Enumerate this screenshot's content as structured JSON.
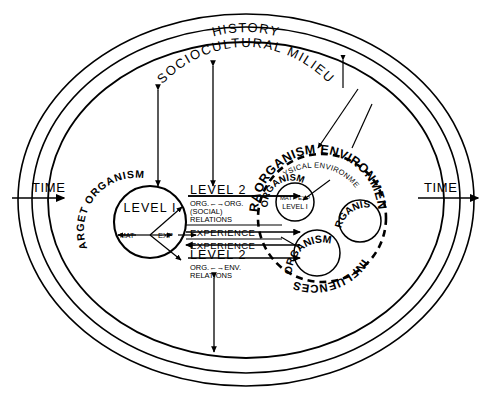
{
  "diagram": {
    "type": "concentric-systems-diagram",
    "title_rings": {
      "outer_ring_label": "HISTORY",
      "inner_ring_label": "SOCIOCULTURAL MILIEU"
    },
    "time_axis": {
      "left_label": "TIME",
      "right_label": "TIME",
      "direction": "left-to-right"
    },
    "target_organism": {
      "curved_label": "TARGET ORGANISM",
      "core_label": "LEVEL I",
      "input_label": "MAT",
      "output_label": "EXP"
    },
    "middle_column": {
      "blocks": [
        {
          "heading": "LEVEL 2",
          "line1": "ORG.←→ORG.",
          "line2": "(SOCIAL)",
          "line3": "RELATIONS"
        },
        {
          "heading": "EXPERIENCE"
        },
        {
          "heading": "EXPERIENCE"
        },
        {
          "heading": "LEVEL 2",
          "line1": "ORG.←→ENV.",
          "line2": "RELATIONS"
        }
      ]
    },
    "extraorganism": {
      "curved_label_top": "EXTRAORGANISM ENVIRONMENTAL",
      "curved_label_bottom": "INFLUENCES",
      "inner_label": "PHYSICAL ENVIRONMENT",
      "organisms": [
        {
          "label": "ORGANISM",
          "core_top": "MAT↔EXP",
          "core_bottom": "LEVEL I"
        },
        {
          "label": "ORGANISM"
        },
        {
          "label": "ORGANISM"
        }
      ]
    },
    "colors": {
      "stroke": "#000000",
      "background": "#ffffff"
    }
  }
}
